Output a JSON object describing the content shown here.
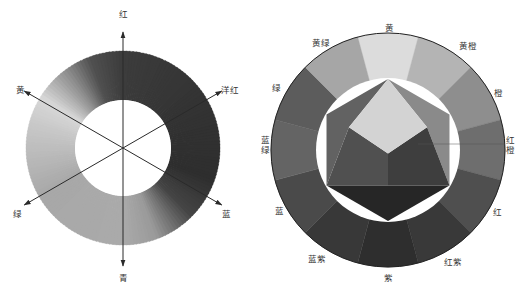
{
  "left_wheel": {
    "title": "",
    "center": [
      123,
      148
    ],
    "outer_radius": 97,
    "inner_radius": 48,
    "axes": [
      {
        "label": "红",
        "angle": -90,
        "label_pos": [
          123,
          14
        ]
      },
      {
        "label": "洋红",
        "angle": -30,
        "label_pos": [
          230,
          90
        ]
      },
      {
        "label": "蓝",
        "angle": 30,
        "label_pos": [
          226,
          214
        ]
      },
      {
        "label": "青",
        "angle": 90,
        "label_pos": [
          123,
          278
        ]
      },
      {
        "label": "绿",
        "angle": 150,
        "label_pos": [
          17,
          214
        ]
      },
      {
        "label": "黄",
        "angle": 210,
        "label_pos": [
          20,
          90
        ]
      }
    ],
    "gradient_stops": [
      {
        "angle": -90,
        "gray": "#3c3c3c"
      },
      {
        "angle": -30,
        "gray": "#333333"
      },
      {
        "angle": 20,
        "gray": "#2e2e2e"
      },
      {
        "angle": 45,
        "gray": "#454545"
      },
      {
        "angle": 70,
        "gray": "#9a9a9a"
      },
      {
        "angle": 90,
        "gray": "#aaaaaa"
      },
      {
        "angle": 150,
        "gray": "#a8a8a8"
      },
      {
        "angle": 195,
        "gray": "#c8c8c8"
      },
      {
        "angle": 212,
        "gray": "#d8d8d8"
      },
      {
        "angle": 235,
        "gray": "#8a8a8a"
      },
      {
        "angle": 250,
        "gray": "#505050"
      }
    ]
  },
  "right_wheel": {
    "center": [
      388,
      150
    ],
    "outer_radius": 117,
    "inner_radius": 72,
    "segments": [
      {
        "label": "黄",
        "label_pos": [
          389,
          28
        ],
        "fill": "#dcdcdc"
      },
      {
        "label": "黄橙",
        "label_pos": [
          468,
          46
        ],
        "fill": "#b4b4b4"
      },
      {
        "label": "橙",
        "label_pos": [
          498,
          93
        ],
        "fill": "#8e8e8e"
      },
      {
        "label": "红橙",
        "label_pos": [
          510,
          146
        ],
        "fill": "#6e6e6e"
      },
      {
        "label": "红",
        "label_pos": [
          497,
          212
        ],
        "fill": "#4f4f4f"
      },
      {
        "label": "红紫",
        "label_pos": [
          453,
          262
        ],
        "fill": "#393939"
      },
      {
        "label": "紫",
        "label_pos": [
          388,
          278
        ],
        "fill": "#2e2e2e"
      },
      {
        "label": "蓝紫",
        "label_pos": [
          317,
          259
        ],
        "fill": "#383838"
      },
      {
        "label": "蓝",
        "label_pos": [
          279,
          211
        ],
        "fill": "#4a4a4a"
      },
      {
        "label": "蓝绿",
        "label_pos": [
          265,
          146
        ],
        "fill": "#646464"
      },
      {
        "label": "绿",
        "label_pos": [
          276,
          88
        ],
        "fill": "#5c5c5c"
      },
      {
        "label": "黄绿",
        "label_pos": [
          321,
          43
        ],
        "fill": "#a6a6a6"
      }
    ],
    "hexagon": {
      "top_triangle_fill": "#d3d3d3",
      "upper_right_fill": "#8a8a8a",
      "upper_left_fill": "#626262",
      "center_left_fill": "#505050",
      "center_right_fill": "#3e3e3e",
      "bottom_fill": "#262626"
    }
  }
}
